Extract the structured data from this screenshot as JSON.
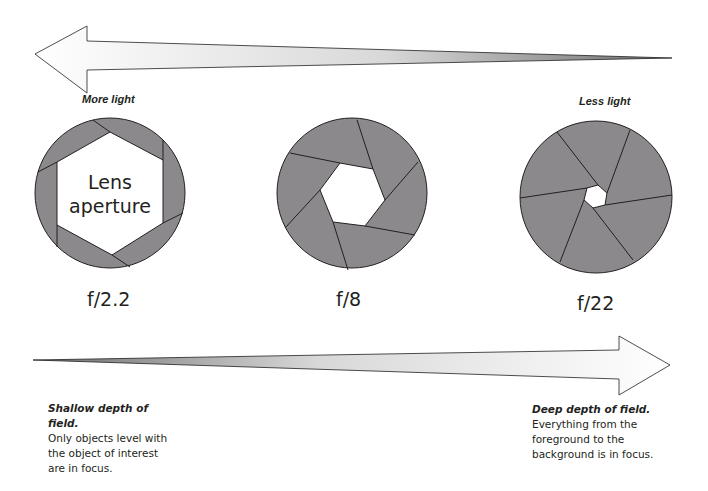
{
  "diagram": {
    "top_arrow": {
      "direction": "left",
      "meaning": "more light",
      "label_left": "More light",
      "label_right": "Less light"
    },
    "apertures": [
      {
        "fstop_label": "f/2.2",
        "opening": "large",
        "inner_text_line1": "Lens",
        "inner_text_line2": "aperture"
      },
      {
        "fstop_label": "f/8",
        "opening": "medium"
      },
      {
        "fstop_label": "f/22",
        "opening": "small"
      }
    ],
    "bottom_arrow": {
      "direction": "right",
      "meaning": "greater depth of field"
    },
    "captions": {
      "left": {
        "title": "Shallow depth of field.",
        "body_lines": [
          "Only objects level with",
          "the object of interest",
          "are in focus."
        ]
      },
      "right": {
        "title": "Deep depth of field.",
        "body_lines": [
          "Everything from the",
          "foreground to the",
          "background is in focus."
        ]
      }
    },
    "colors": {
      "blade_fill": "#8c898c",
      "outline": "#231f20",
      "arrow_light": "#ffffff",
      "arrow_dark": "#8f8f8f"
    }
  }
}
